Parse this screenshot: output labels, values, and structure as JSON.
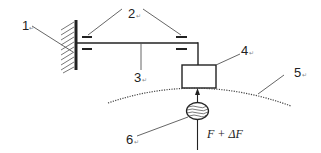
{
  "diagram": {
    "type": "mechanical-schematic",
    "labels": {
      "wall": "1",
      "bearings": "2",
      "beam": "3",
      "sensor_block": "4",
      "surface": "5",
      "roller": "6"
    },
    "force_label": "F + ΔF",
    "colors": {
      "line": "#222222",
      "leader": "#555555",
      "background": "#ffffff"
    },
    "parts": [
      {
        "id": "1",
        "name": "fixed wall"
      },
      {
        "id": "2",
        "name": "bearings"
      },
      {
        "id": "3",
        "name": "shaft / beam"
      },
      {
        "id": "4",
        "name": "block"
      },
      {
        "id": "5",
        "name": "curved surface (dotted)"
      },
      {
        "id": "6",
        "name": "ellipsoidal body with force arrow"
      }
    ]
  }
}
